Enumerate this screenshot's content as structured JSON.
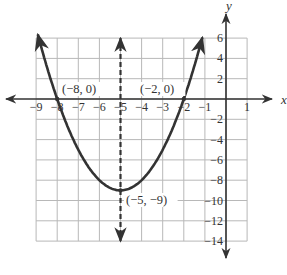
{
  "chart_data": {
    "type": "line",
    "title": "",
    "xlabel": "x",
    "ylabel": "y",
    "xlim": [
      -9,
      1
    ],
    "ylim": [
      -14,
      6
    ],
    "grid": true,
    "x_ticks": [
      -9,
      -8,
      -7,
      -6,
      -5,
      -4,
      -3,
      -2,
      -1,
      1
    ],
    "x_tick_labels": [
      "−9",
      "−8",
      "−7",
      "−6",
      "−5",
      "−4",
      "−3",
      "−2",
      "−1",
      "1"
    ],
    "y_ticks": [
      6,
      4,
      2,
      -2,
      -4,
      -6,
      -8,
      -10,
      -12,
      -14
    ],
    "y_tick_labels": [
      "6",
      "4",
      "2",
      "−2",
      "−4",
      "−6",
      "−8",
      "−10",
      "−12",
      "−14"
    ],
    "series": [
      {
        "name": "parabola",
        "equation": "y = (x + 5)^2 - 9",
        "style": "solid",
        "x": [
          -8.9,
          -8,
          -7,
          -6,
          -5,
          -4,
          -3,
          -2,
          -1.1
        ],
        "y": [
          6.21,
          0,
          -5,
          -8,
          -9,
          -8,
          -5,
          0,
          6.21
        ]
      },
      {
        "name": "axis of symmetry",
        "equation": "x = -5",
        "style": "dashed",
        "x": [
          -5,
          -5
        ],
        "y": [
          6,
          -14
        ]
      }
    ],
    "annotations": [
      {
        "text": "(−8, 0)",
        "x": -8,
        "y": 0
      },
      {
        "text": "(−2, 0)",
        "x": -2,
        "y": 0
      },
      {
        "text": "(−5, −9)",
        "x": -5,
        "y": -9
      }
    ]
  },
  "labels": {
    "x_axis": "x",
    "y_axis": "y",
    "point_left_intercept": "(−8, 0)",
    "point_right_intercept": "(−2, 0)",
    "point_vertex": "(−5, −9)"
  },
  "colors": {
    "grid": "#b8b8b8",
    "axis": "#333333",
    "curve": "#333333"
  }
}
